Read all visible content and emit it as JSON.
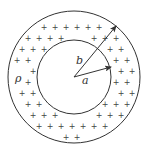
{
  "figure": {
    "colors": {
      "stroke": "#333333",
      "charge": "#444444",
      "background": "#ffffff"
    },
    "center": [
      74,
      77
    ],
    "outer_circle": {
      "radius": 66
    },
    "inner_circle": {
      "radius": 37
    },
    "labels": {
      "density": "ρ",
      "outer_radius": "b",
      "inner_radius": "a"
    },
    "charge_symbol": "+",
    "arrows": [
      {
        "name": "outer-radius-arrow",
        "label": "b",
        "from": [
          74,
          77
        ],
        "to": [
          116,
          26
        ]
      },
      {
        "name": "inner-radius-arrow",
        "label": "a",
        "from": [
          74,
          77
        ],
        "to": [
          111,
          67
        ]
      }
    ]
  }
}
